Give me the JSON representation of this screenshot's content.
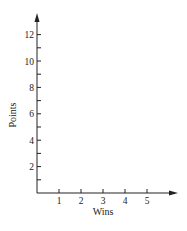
{
  "chart_data": {
    "type": "scatter",
    "title": "",
    "xlabel": "Wins",
    "ylabel": "Points",
    "x_ticks": [
      1,
      2,
      3,
      4,
      5
    ],
    "x_tick_labels": [
      "1",
      "2",
      "3",
      "4",
      "5"
    ],
    "y_ticks": [
      1,
      2,
      3,
      4,
      5,
      6,
      7,
      8,
      9,
      10,
      11,
      12
    ],
    "y_tick_labels": [
      "2",
      "4",
      "6",
      "8",
      "10",
      "12"
    ],
    "y_labeled_ticks": [
      2,
      4,
      6,
      8,
      10,
      12
    ],
    "xlim": [
      0,
      6.5
    ],
    "ylim": [
      0,
      13.5
    ],
    "grid": false,
    "legend": null,
    "series": [],
    "note": "Empty coordinate axes with arrowheads; no data points plotted"
  },
  "axes": {
    "x_label": "Wins",
    "y_label": "Points",
    "color": "#222222"
  }
}
